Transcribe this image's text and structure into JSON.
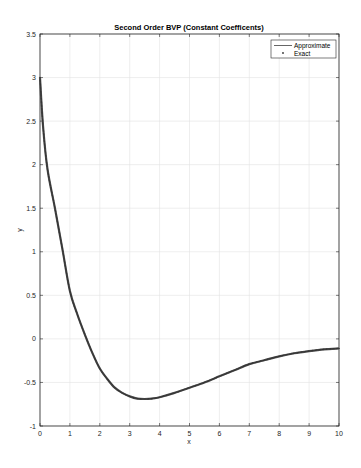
{
  "chart_data": {
    "type": "line",
    "title": "Second Order BVP (Constant Coefficents)",
    "xlabel": "x",
    "ylabel": "y",
    "xlim": [
      0,
      10
    ],
    "ylim": [
      -1,
      3.5
    ],
    "xticks": [
      0,
      1,
      2,
      3,
      4,
      5,
      6,
      7,
      8,
      9,
      10
    ],
    "yticks": [
      -1,
      -0.5,
      0,
      0.5,
      1,
      1.5,
      2,
      2.5,
      3,
      3.5
    ],
    "xtick_labels": [
      "0",
      "1",
      "2",
      "3",
      "4",
      "5",
      "6",
      "7",
      "8",
      "9",
      "10"
    ],
    "ytick_labels": [
      "-1",
      "-0.5",
      "0",
      "0.5",
      "1",
      "1.5",
      "2",
      "2.5",
      "3",
      "3.5"
    ],
    "grid": true,
    "legend_position": "upper right",
    "series": [
      {
        "name": "Approximate",
        "style": "line",
        "color": "#555555",
        "x": [
          0,
          0.1,
          0.25,
          0.5,
          0.75,
          1,
          1.25,
          1.5,
          1.75,
          2,
          2.25,
          2.5,
          2.75,
          3,
          3.25,
          3.5,
          3.75,
          4,
          4.5,
          5,
          5.5,
          6,
          6.5,
          7,
          7.5,
          8,
          8.5,
          9,
          9.5,
          10
        ],
        "y": [
          3,
          2.45,
          1.95,
          1.5,
          1.03,
          0.55,
          0.28,
          0.05,
          -0.16,
          -0.34,
          -0.46,
          -0.56,
          -0.62,
          -0.66,
          -0.685,
          -0.69,
          -0.685,
          -0.67,
          -0.62,
          -0.56,
          -0.5,
          -0.43,
          -0.36,
          -0.29,
          -0.245,
          -0.2,
          -0.165,
          -0.14,
          -0.12,
          -0.11
        ]
      },
      {
        "name": "Exact",
        "style": "markers",
        "color": "#333333",
        "x": [
          0,
          0.1,
          0.25,
          0.5,
          0.75,
          1,
          1.25,
          1.5,
          1.75,
          2,
          2.25,
          2.5,
          2.75,
          3,
          3.25,
          3.5,
          3.75,
          4,
          4.5,
          5,
          5.5,
          6,
          6.5,
          7,
          7.5,
          8,
          8.5,
          9,
          9.5,
          10
        ],
        "y": [
          3,
          2.45,
          1.95,
          1.5,
          1.03,
          0.55,
          0.28,
          0.05,
          -0.16,
          -0.34,
          -0.46,
          -0.56,
          -0.62,
          -0.66,
          -0.685,
          -0.69,
          -0.685,
          -0.67,
          -0.62,
          -0.56,
          -0.5,
          -0.43,
          -0.36,
          -0.29,
          -0.245,
          -0.2,
          -0.165,
          -0.14,
          -0.12,
          -0.11
        ]
      }
    ]
  }
}
